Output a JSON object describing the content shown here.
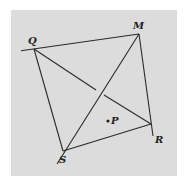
{
  "figure": {
    "background": "#dcdcdc",
    "line_color": "#2a2a2a",
    "points": {
      "Q": {
        "label": "Q",
        "x": 34,
        "y": 49
      },
      "M": {
        "label": "M",
        "x": 139,
        "y": 34
      },
      "R": {
        "label": "R",
        "x": 151,
        "y": 124
      },
      "S": {
        "label": "S",
        "x": 63,
        "y": 151
      },
      "P": {
        "label": "P",
        "x": 108,
        "y": 121
      }
    },
    "segments": [
      "QM",
      "MR",
      "RS",
      "SQ",
      "QR",
      "MS"
    ],
    "labels": {
      "Q": "Q",
      "M": "M",
      "R": "R",
      "S": "S",
      "P": "P"
    }
  }
}
